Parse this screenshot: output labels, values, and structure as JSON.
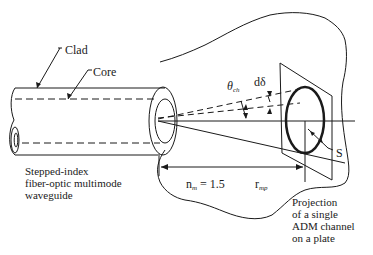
{
  "figure": {
    "labels": {
      "clad": "Clad",
      "core": "Core",
      "theta_symbol": "θ",
      "theta_sub": "ch",
      "d_delta": "dδ",
      "s": "S",
      "n_m_base": "n",
      "n_m_sub": "m",
      "n_m_value": " = 1.5",
      "r_base": "r",
      "r_sub": "mp"
    },
    "captions": {
      "waveguide": [
        "Stepped-index",
        "fiber-optic multimode",
        "waveguide"
      ],
      "projection": [
        "Projection",
        "of a single",
        "ADM channel",
        "on a plate"
      ]
    },
    "colors": {
      "ink": "#1a1a1a",
      "background": "#ffffff"
    }
  }
}
